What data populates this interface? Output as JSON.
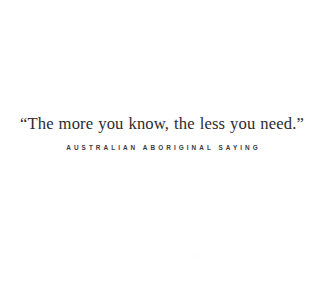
{
  "card": {
    "background_color": "#ffffff",
    "quote": {
      "text": "“The more you know, the less you need.”",
      "color": "#2b2b30"
    },
    "attribution": {
      "text": "AUSTRALIAN ABORIGINAL SAYING",
      "color": "#3a3a40"
    }
  }
}
